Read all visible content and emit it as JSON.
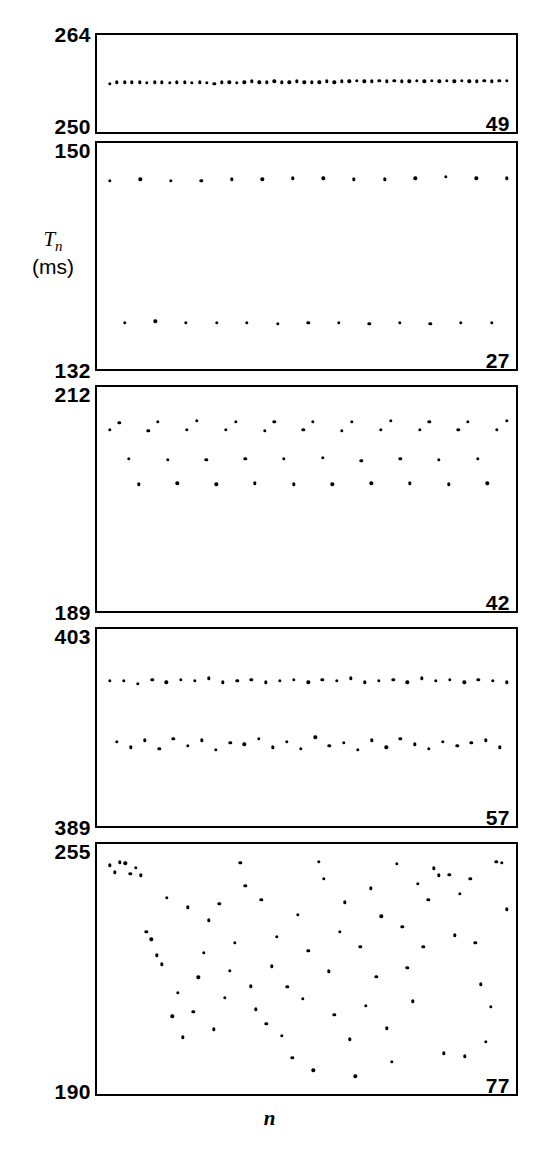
{
  "figure": {
    "y_axis_title_symbol": "T",
    "y_axis_title_subscript": "n",
    "y_axis_title_units": "(ms)",
    "x_axis_title": "n",
    "dot_color": "#000000",
    "axis_color": "#000000",
    "background_color": "#ffffff"
  },
  "chart_data": {
    "type": "scatter",
    "title": "",
    "subtitle": "",
    "xlabel": "n",
    "ylabel": "T_n (ms)",
    "grid": false,
    "legend": null,
    "layout": "5 stacked panels sharing the x axis; each panel has its own y range labelled at top-left and bottom-left, and an index number in the bottom-right corner",
    "panels": [
      {
        "index": 0,
        "panel_number": "49",
        "ylim": [
          250,
          264
        ],
        "ytick_top": "264",
        "ytick_bottom": "250",
        "periodicity": "period-1 (single band, dense)",
        "n_points": 54,
        "description": "One nearly flat band of closely spaced dots just above the middle of the panel",
        "values": [
          257.0,
          257.2,
          257.2,
          257.2,
          257.2,
          257.1,
          257.2,
          257.2,
          257.1,
          257.2,
          257.2,
          257.1,
          257.2,
          257.1,
          257.0,
          257.2,
          257.2,
          257.1,
          257.2,
          257.3,
          257.2,
          257.2,
          257.3,
          257.2,
          257.2,
          257.3,
          257.2,
          257.2,
          257.2,
          257.3,
          257.2,
          257.3,
          257.3,
          257.4,
          257.3,
          257.3,
          257.4,
          257.3,
          257.4,
          257.3,
          257.3,
          257.4,
          257.3,
          257.4,
          257.3,
          257.4,
          257.3,
          257.4,
          257.3,
          257.3,
          257.4,
          257.3,
          257.4,
          257.4
        ]
      },
      {
        "index": 1,
        "panel_number": "27",
        "ylim": [
          132,
          150
        ],
        "ytick_top": "150",
        "ytick_bottom": "132",
        "periodicity": "period-2 (two bands)",
        "n_points": 27,
        "description": "Two widely separated flat bands, alternating high / low on successive beats",
        "values": [
          147.0,
          135.7,
          147.1,
          135.8,
          147.0,
          135.7,
          147.0,
          135.7,
          147.1,
          135.7,
          147.1,
          135.6,
          147.2,
          135.7,
          147.2,
          135.7,
          147.1,
          135.6,
          147.1,
          135.7,
          147.2,
          135.6,
          147.3,
          135.7,
          147.2,
          135.7,
          147.2
        ]
      },
      {
        "index": 2,
        "panel_number": "42",
        "ylim": [
          189,
          212
        ],
        "ytick_top": "212",
        "ytick_bottom": "189",
        "periodicity": "period-4 (four bands, two nearly merged near the top)",
        "n_points": 42,
        "description": "Four bands: an upper pair of closely spaced levels, a middle level, and a low level",
        "values": [
          207.6,
          208.3,
          204.6,
          202.0,
          207.5,
          208.4,
          204.5,
          202.1,
          207.6,
          208.5,
          204.5,
          202.0,
          207.6,
          208.4,
          204.6,
          202.1,
          207.5,
          208.4,
          204.6,
          202.0,
          207.6,
          208.4,
          204.7,
          202.0,
          207.5,
          208.4,
          204.4,
          202.1,
          207.6,
          208.5,
          204.6,
          202.1,
          207.6,
          208.4,
          204.5,
          202.0,
          207.6,
          208.4,
          204.6,
          202.1,
          207.6,
          208.5
        ]
      },
      {
        "index": 3,
        "panel_number": "57",
        "ylim": [
          389,
          403
        ],
        "ytick_top": "403",
        "ytick_bottom": "389",
        "periodicity": "higher-order periodicity / weakly chaotic banding (about four bands with scatter)",
        "n_points": 57,
        "description": "One well separated upper band plus three lower bands with visible jitter",
        "values": [
          399.3,
          395.0,
          399.3,
          394.6,
          399.1,
          395.1,
          399.4,
          394.5,
          399.2,
          395.2,
          399.4,
          394.7,
          399.3,
          395.1,
          399.5,
          394.4,
          399.2,
          394.9,
          399.3,
          394.8,
          399.4,
          395.2,
          399.2,
          394.6,
          399.3,
          395.0,
          399.4,
          394.5,
          399.2,
          395.3,
          399.4,
          394.7,
          399.3,
          394.9,
          399.5,
          394.4,
          399.2,
          395.1,
          399.3,
          394.6,
          399.4,
          395.2,
          399.2,
          394.8,
          399.5,
          394.5,
          399.3,
          395.0,
          399.4,
          394.7,
          399.2,
          394.9,
          399.4,
          395.1,
          399.3,
          394.6,
          399.2
        ]
      },
      {
        "index": 4,
        "panel_number": "77",
        "ylim": [
          190,
          255
        ],
        "ytick_top": "255",
        "ytick_bottom": "190",
        "periodicity": "aperiodic / chaotic (points fill the band)",
        "n_points": 77,
        "description": "Irregular scatter filling most of the vertical range with no visible banding",
        "values": [
          249.5,
          247.6,
          250.2,
          250.0,
          247.3,
          248.8,
          246.9,
          232.1,
          230.2,
          226.1,
          223.7,
          241.0,
          210.2,
          216.3,
          204.7,
          238.5,
          211.4,
          220.3,
          226.7,
          235.2,
          206.8,
          239.5,
          215.0,
          222.0,
          229.3,
          250.1,
          244.2,
          218.0,
          212.0,
          240.5,
          208.3,
          223.2,
          230.9,
          205.1,
          217.9,
          199.4,
          236.6,
          214.8,
          227.3,
          196.2,
          250.3,
          246.0,
          221.9,
          210.6,
          232.2,
          239.8,
          204.2,
          194.6,
          228.3,
          213.0,
          243.5,
          220.4,
          236.2,
          207.1,
          198.4,
          249.8,
          233.5,
          222.8,
          214.1,
          244.7,
          228.2,
          240.5,
          248.7,
          246.9,
          200.6,
          247.0,
          231.3,
          242.0,
          199.8,
          245.9,
          229.3,
          218.5,
          203.6,
          212.7,
          250.4,
          250.1,
          238.0
        ]
      }
    ]
  }
}
